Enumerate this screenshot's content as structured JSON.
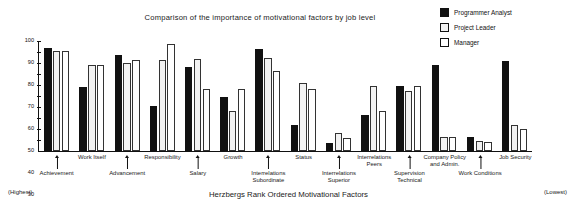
{
  "chart_data": {
    "type": "bar",
    "title": "Comparison of the importance of motivational factors by job level",
    "xlabel": "Herzbergs Rank Ordered Motivational Factors",
    "ylabel": "",
    "ylim": [
      0,
      100
    ],
    "yticks": [
      10,
      20,
      30,
      40,
      50,
      60,
      70,
      80,
      90,
      100
    ],
    "grid": false,
    "legend_position": "top-right",
    "categories": [
      "Achievement",
      "Work Itself",
      "Advancement",
      "Responsibility",
      "Salary",
      "Growth",
      "Interrelations Subordinate",
      "Status",
      "Interrelations Superior",
      "Interrelations Peers",
      "Supervision Technical",
      "Company Policy and Admin.",
      "Work Conditions",
      "Job Security"
    ],
    "series": [
      {
        "name": "Programmer Analyst",
        "color": "#111111",
        "values": [
          94,
          58,
          87,
          41,
          76,
          49,
          93,
          24,
          7,
          33,
          59,
          78,
          13,
          82
        ]
      },
      {
        "name": "Project Leader",
        "color": "#f2f2f2",
        "values": [
          91,
          78,
          80,
          83,
          84,
          36,
          85,
          62,
          16,
          59,
          55,
          13,
          9,
          24
        ]
      },
      {
        "name": "Manager",
        "color": "#ffffff",
        "values": [
          91,
          78,
          83,
          97,
          56,
          56,
          73,
          56,
          12,
          36,
          59,
          13,
          8,
          20
        ]
      }
    ],
    "annotations": {
      "left_note": "(Highest)",
      "right_note": "(Lowest)"
    }
  },
  "legend": {
    "items": [
      {
        "label": "Programmer Analyst",
        "swatch": "filled-black-swatch"
      },
      {
        "label": "Project Leader",
        "swatch": "light-gray-swatch"
      },
      {
        "label": "Manager",
        "swatch": "white-swatch"
      }
    ]
  }
}
